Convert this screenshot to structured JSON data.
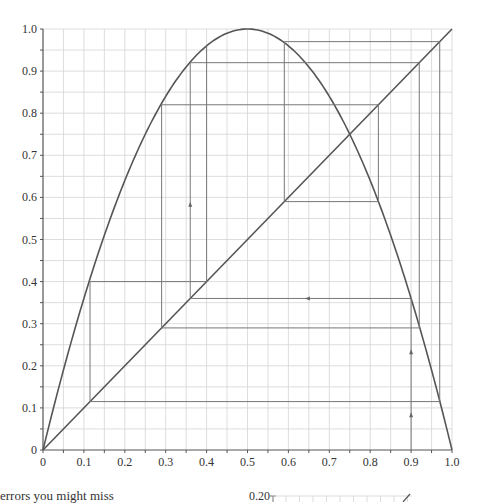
{
  "chart_data": {
    "type": "line",
    "title": "",
    "xlabel": "",
    "ylabel": "",
    "xlim": [
      0,
      1.0
    ],
    "ylim": [
      0,
      1.0
    ],
    "grid": true,
    "x_ticks": [
      "0",
      "0.1",
      "0.2",
      "0.3",
      "0.4",
      "0.5",
      "0.6",
      "0.7",
      "0.8",
      "0.9",
      "1.0"
    ],
    "y_ticks": [
      "0",
      "0.1",
      "0.2",
      "0.3",
      "0.4",
      "0.5",
      "0.6",
      "0.7",
      "0.8",
      "0.9",
      "1.0"
    ],
    "series": [
      {
        "name": "logistic map f(x)=4x(1-x)",
        "kind": "curve"
      },
      {
        "name": "diagonal y=x",
        "kind": "line",
        "points": [
          [
            0,
            0
          ],
          [
            1,
            1
          ]
        ]
      },
      {
        "name": "cobweb",
        "kind": "path",
        "points": [
          [
            0.9,
            0
          ],
          [
            0.9,
            0.36
          ],
          [
            0.36,
            0.36
          ],
          [
            0.36,
            0.92
          ],
          [
            0.92,
            0.92
          ],
          [
            0.92,
            0.29
          ],
          [
            0.29,
            0.29
          ],
          [
            0.29,
            0.82
          ],
          [
            0.82,
            0.82
          ],
          [
            0.82,
            0.59
          ],
          [
            0.59,
            0.59
          ],
          [
            0.59,
            0.97
          ],
          [
            0.97,
            0.97
          ],
          [
            0.97,
            0.115
          ],
          [
            0.115,
            0.115
          ],
          [
            0.115,
            0.4
          ],
          [
            0.4,
            0.4
          ],
          [
            0.4,
            0.96
          ]
        ]
      }
    ],
    "arrows": [
      {
        "at": [
          0.9,
          0.08
        ],
        "dir": "up"
      },
      {
        "at": [
          0.9,
          0.23
        ],
        "dir": "up"
      },
      {
        "at": [
          0.65,
          0.36
        ],
        "dir": "left"
      },
      {
        "at": [
          0.36,
          0.58
        ],
        "dir": "up"
      }
    ]
  },
  "caption": {
    "text": "errors you might miss"
  },
  "inset": {
    "y_tick_label": "0.20"
  }
}
